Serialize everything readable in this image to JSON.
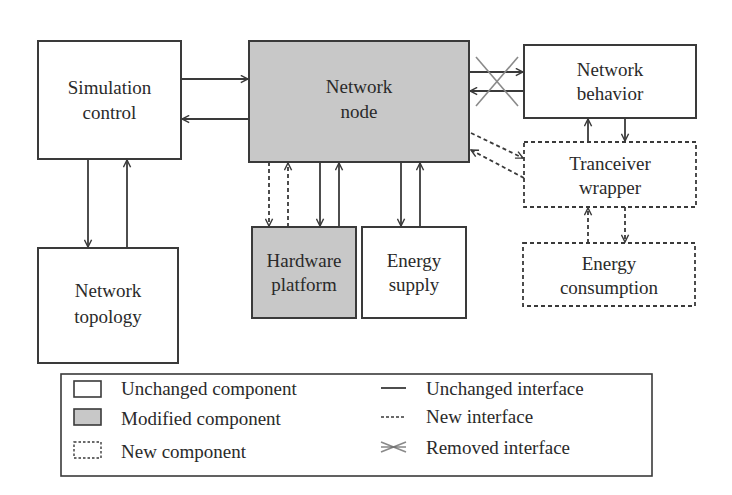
{
  "colors": {
    "stroke": "#3a3a3a",
    "modified_fill": "#c8c8c8",
    "unchanged_fill": "#ffffff",
    "removed_x": "#8a8a8a"
  },
  "components": {
    "simulation_control": {
      "line1": "Simulation",
      "line2": "control",
      "status": "unchanged"
    },
    "network_node": {
      "line1": "Network",
      "line2": "node",
      "status": "modified"
    },
    "network_behavior": {
      "line1": "Network",
      "line2": "behavior",
      "status": "unchanged"
    },
    "tranceiver_wrapper": {
      "line1": "Tranceiver",
      "line2": "wrapper",
      "status": "new"
    },
    "network_topology": {
      "line1": "Network",
      "line2": "topology",
      "status": "unchanged"
    },
    "hardware_platform": {
      "line1": "Hardware",
      "line2": "platform",
      "status": "modified"
    },
    "energy_supply": {
      "line1": "Energy",
      "line2": "supply",
      "status": "unchanged"
    },
    "energy_consumption": {
      "line1": "Energy",
      "line2": "consumption",
      "status": "new"
    }
  },
  "interfaces": [
    {
      "from": "Simulation control",
      "to": "Network node",
      "type": "unchanged"
    },
    {
      "from": "Network node",
      "to": "Simulation control",
      "type": "unchanged"
    },
    {
      "from": "Simulation control",
      "to": "Network topology",
      "type": "unchanged"
    },
    {
      "from": "Network topology",
      "to": "Simulation control",
      "type": "unchanged"
    },
    {
      "from": "Network node",
      "to": "Network behavior",
      "type": "removed"
    },
    {
      "from": "Network behavior",
      "to": "Network node",
      "type": "removed"
    },
    {
      "from": "Network node",
      "to": "Tranceiver wrapper",
      "type": "new"
    },
    {
      "from": "Tranceiver wrapper",
      "to": "Network node",
      "type": "new"
    },
    {
      "from": "Tranceiver wrapper",
      "to": "Network behavior",
      "type": "unchanged"
    },
    {
      "from": "Network behavior",
      "to": "Tranceiver wrapper",
      "type": "unchanged"
    },
    {
      "from": "Network node",
      "to": "Hardware platform",
      "type": "new"
    },
    {
      "from": "Hardware platform",
      "to": "Network node",
      "type": "new"
    },
    {
      "from": "Network node",
      "to": "Hardware platform",
      "type": "unchanged"
    },
    {
      "from": "Hardware platform",
      "to": "Network node",
      "type": "unchanged"
    },
    {
      "from": "Network node",
      "to": "Energy supply",
      "type": "unchanged"
    },
    {
      "from": "Energy supply",
      "to": "Network node",
      "type": "unchanged"
    },
    {
      "from": "Energy consumption",
      "to": "Tranceiver wrapper",
      "type": "new"
    },
    {
      "from": "Tranceiver wrapper",
      "to": "Energy consumption",
      "type": "new"
    }
  ],
  "legend": {
    "components": [
      {
        "label": "Unchanged component",
        "icon": "solid-box"
      },
      {
        "label": "Modified component",
        "icon": "grey-box"
      },
      {
        "label": "New component",
        "icon": "dashed-box"
      }
    ],
    "interfaces": [
      {
        "label": "Unchanged interface",
        "icon": "solid-line"
      },
      {
        "label": "New interface",
        "icon": "dashed-line"
      },
      {
        "label": "Removed interface",
        "icon": "crossed-lines"
      }
    ]
  }
}
